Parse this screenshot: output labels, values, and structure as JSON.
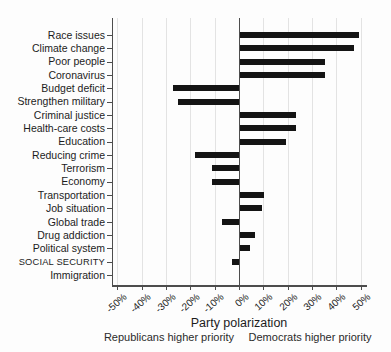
{
  "chart_data": {
    "type": "bar",
    "orientation": "horizontal-diverging",
    "title": "",
    "xlabel": "Party polarization",
    "ylabel": "",
    "xlim": [
      -50,
      50
    ],
    "grid": true,
    "legend": false,
    "categories": [
      "Race issues",
      "Climate change",
      "Poor people",
      "Coronavirus",
      "Budget deficit",
      "Strengthen military",
      "Criminal justice",
      "Health-care costs",
      "Education",
      "Reducing crime",
      "Terrorism",
      "Economy",
      "Transportation",
      "Job situation",
      "Global trade",
      "Drug addiction",
      "Political system",
      "SOCIAL SECURITY",
      "Immigration"
    ],
    "values": [
      49,
      47,
      35,
      35,
      -27,
      -25,
      23,
      23,
      19,
      -18,
      -11,
      -11,
      10,
      9,
      -7,
      6,
      4,
      -3,
      0
    ],
    "value_unit": "%",
    "x_ticks": [
      {
        "label": "-50%",
        "value": -50
      },
      {
        "label": "-40%",
        "value": -40
      },
      {
        "label": "-30%",
        "value": -30
      },
      {
        "label": "-20%",
        "value": -20
      },
      {
        "label": "-10%",
        "value": -10
      },
      {
        "label": "0%",
        "value": 0
      },
      {
        "label": "10%",
        "value": 10
      },
      {
        "label": "20%",
        "value": 20
      },
      {
        "label": "30%",
        "value": 30
      },
      {
        "label": "40%",
        "value": 40
      },
      {
        "label": "50%",
        "value": 50
      }
    ],
    "annotations": {
      "left": "Republicans higher priority",
      "right": "Democrats higher priority"
    },
    "colors": {
      "bar": "#141414",
      "axis": "#4d4d4d",
      "zero_line": "#4d4d4d",
      "gridline": "#e3e3e3",
      "text": "#1c1c1c"
    }
  }
}
